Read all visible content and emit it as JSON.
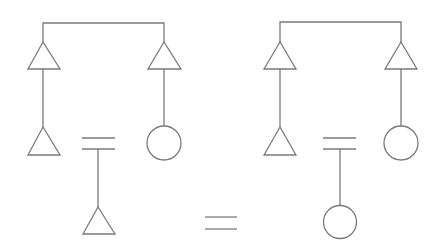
{
  "diagram": {
    "left_tree": {
      "top_nodes": [
        "triangle",
        "triangle"
      ],
      "bottom_nodes": [
        "triangle",
        "circle"
      ],
      "inner_operator": "equals",
      "inner_child": "triangle"
    },
    "main_operator": "equals",
    "right_tree": {
      "top_nodes": [
        "triangle",
        "triangle"
      ],
      "bottom_nodes": [
        "triangle",
        "circle"
      ],
      "inner_operator": "equals",
      "inner_child": "circle"
    },
    "colors": {
      "stroke": "#7a7a7a",
      "background": "#ffffff"
    }
  }
}
